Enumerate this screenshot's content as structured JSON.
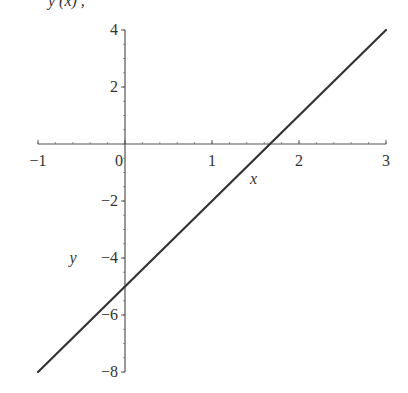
{
  "chart_data": {
    "type": "line",
    "title": "",
    "xlabel": "x",
    "ylabel": "y",
    "xlim": [
      -1,
      3
    ],
    "ylim": [
      -8,
      4
    ],
    "xticks": [
      -1,
      0,
      1,
      2,
      3
    ],
    "xtick_labels": [
      "−1",
      "0",
      "1",
      "2",
      "3"
    ],
    "yticks": [
      -8,
      -6,
      -4,
      -2,
      2,
      4
    ],
    "ytick_labels": [
      "−8",
      "−6",
      "−4",
      "−2",
      "2",
      "4"
    ],
    "grid": false,
    "series": [
      {
        "name": "y = 3x - 5",
        "x": [
          -1,
          3
        ],
        "y": [
          -8,
          4
        ],
        "color": "#333333"
      }
    ]
  },
  "layout": {
    "x_pixel_range": [
      38,
      386
    ],
    "y_pixel_range": [
      372,
      30
    ],
    "axis_color": "#555555",
    "line_color": "#333333",
    "title_fragment": "y (x)          ,"
  }
}
